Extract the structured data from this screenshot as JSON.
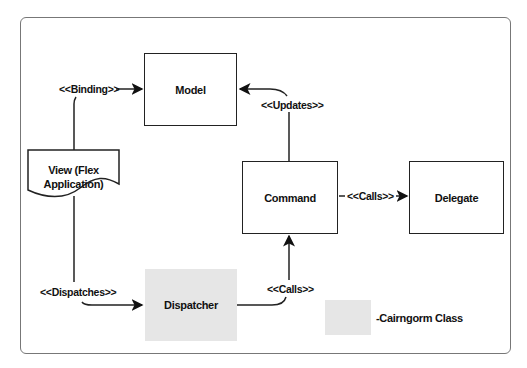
{
  "diagram": {
    "nodes": {
      "model": "Model",
      "view_line1": "View (Flex",
      "view_line2": "Application)",
      "command": "Command",
      "delegate": "Delegate",
      "dispatcher": "Dispatcher"
    },
    "edges": {
      "binding": "<<Binding>>",
      "updates": "<<Updates>>",
      "calls_delegate": "<<Calls>>",
      "dispatches": "<<Dispatches>>",
      "calls_command": "<<Calls>>"
    },
    "legend": {
      "label": "-Cairngorm Class",
      "swatch_color": "#e6e6e6"
    }
  }
}
